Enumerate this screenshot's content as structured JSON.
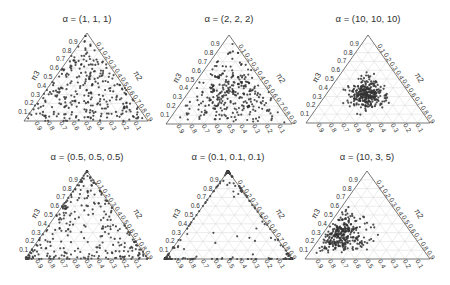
{
  "figure": {
    "width": 450,
    "height": 285,
    "point_color": "#333333",
    "grid_color": "#d9d9d9",
    "frame_color": "#555555",
    "text_color": "#333333"
  },
  "chart_data": [
    {
      "type": "scatter",
      "subtype": "ternary",
      "title": "α = (1, 1, 1)",
      "alpha": [
        1,
        1,
        1
      ],
      "axes": {
        "left": "π3",
        "right": "π2",
        "bottom": "π1"
      },
      "ticks": [
        0.1,
        0.2,
        0.3,
        0.4,
        0.5,
        0.6,
        0.7,
        0.8,
        0.9
      ],
      "grid": true,
      "distribution": "uniform over simplex",
      "n_points_approx": 300,
      "geometry": {
        "apex": [
          87,
          33
        ],
        "base_left": [
          24,
          121
        ],
        "base_right": [
          148,
          121
        ],
        "title_y": 22
      }
    },
    {
      "type": "scatter",
      "subtype": "ternary",
      "title": "α = (2, 2, 2)",
      "alpha": [
        2,
        2,
        2
      ],
      "axes": {
        "left": "π3",
        "right": "π2",
        "bottom": "π1"
      },
      "ticks": [
        0.1,
        0.2,
        0.3,
        0.4,
        0.5,
        0.6,
        0.7,
        0.8,
        0.9
      ],
      "grid": true,
      "distribution": "moderately concentrated at center",
      "n_points_approx": 300,
      "geometry": {
        "apex": [
          229,
          35
        ],
        "base_left": [
          166,
          124
        ],
        "base_right": [
          292,
          124
        ],
        "title_y": 22
      }
    },
    {
      "type": "scatter",
      "subtype": "ternary",
      "title": "α = (10, 10, 10)",
      "alpha": [
        10,
        10,
        10
      ],
      "axes": {
        "left": "π3",
        "right": "π2",
        "bottom": "π1"
      },
      "ticks": [
        0.1,
        0.2,
        0.3,
        0.4,
        0.5,
        0.6,
        0.7,
        0.8,
        0.9
      ],
      "grid": true,
      "distribution": "tightly concentrated at center (1/3, 1/3, 1/3)",
      "n_points_approx": 300,
      "geometry": {
        "apex": [
          368,
          35
        ],
        "base_left": [
          306,
          123
        ],
        "base_right": [
          430,
          123
        ],
        "title_y": 22
      }
    },
    {
      "type": "scatter",
      "subtype": "ternary",
      "title": "α = (0.5, 0.5, 0.5)",
      "alpha": [
        0.5,
        0.5,
        0.5
      ],
      "axes": {
        "left": "π3",
        "right": "π2",
        "bottom": "π1"
      },
      "ticks": [
        0.1,
        0.2,
        0.3,
        0.4,
        0.5,
        0.6,
        0.7,
        0.8,
        0.9
      ],
      "grid": true,
      "distribution": "pushed toward edges and corners",
      "n_points_approx": 300,
      "geometry": {
        "apex": [
          87,
          171
        ],
        "base_left": [
          25,
          259
        ],
        "base_right": [
          148,
          259
        ],
        "title_y": 160
      }
    },
    {
      "type": "scatter",
      "subtype": "ternary",
      "title": "α = (0.1, 0.1, 0.1)",
      "alpha": [
        0.1,
        0.1,
        0.1
      ],
      "axes": {
        "left": "π3",
        "right": "π2",
        "bottom": "π1"
      },
      "ticks": [
        0.1,
        0.2,
        0.3,
        0.4,
        0.5,
        0.6,
        0.7,
        0.8,
        0.9
      ],
      "grid": true,
      "distribution": "almost all points on corners/edges, few interior",
      "n_points_approx": 300,
      "geometry": {
        "apex": [
          228,
          171
        ],
        "base_left": [
          165,
          259
        ],
        "base_right": [
          292,
          259
        ],
        "title_y": 160
      }
    },
    {
      "type": "scatter",
      "subtype": "ternary",
      "title": "α = (10, 3, 5)",
      "alpha": [
        10,
        3,
        5
      ],
      "axes": {
        "left": "π3",
        "right": "π2",
        "bottom": "π1"
      },
      "ticks": [
        0.1,
        0.2,
        0.3,
        0.4,
        0.5,
        0.6,
        0.7,
        0.8,
        0.9
      ],
      "grid": true,
      "distribution": "cluster near lower-left (high π1)",
      "n_points_approx": 300,
      "geometry": {
        "apex": [
          367,
          171
        ],
        "base_left": [
          305,
          259
        ],
        "base_right": [
          430,
          259
        ],
        "title_y": 160
      }
    }
  ]
}
